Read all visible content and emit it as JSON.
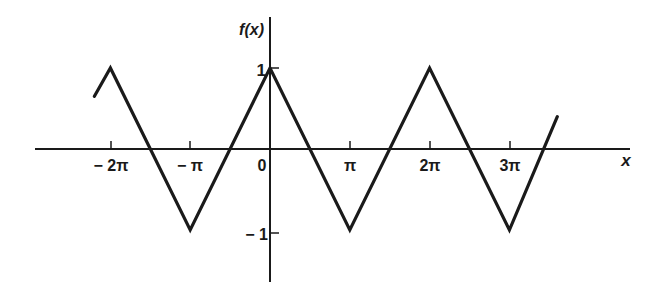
{
  "chart_data": {
    "type": "line",
    "title": "",
    "xlabel": "x",
    "ylabel": "f(x)",
    "x_tick_labels": [
      "− 2π",
      "− π",
      "0",
      "π",
      "2π",
      "3π"
    ],
    "x_tick_values_in_pi": [
      -2,
      -1,
      0,
      1,
      2,
      3
    ],
    "y_tick_labels": [
      "1",
      "− 1"
    ],
    "y_tick_values": [
      1,
      -1
    ],
    "xlim_in_pi": [
      -3.0,
      4.5
    ],
    "ylim": [
      -1.7,
      1.6
    ],
    "grid": false,
    "legend": null,
    "series": [
      {
        "name": "f(x) triangle wave",
        "description": "Periodic triangle wave, period 2π, amplitude 1, peaks at even multiples of π, troughs at odd multiples of π",
        "x_in_pi": [
          -2.2,
          -2,
          -1,
          0,
          1,
          2,
          3,
          3.6
        ],
        "y": [
          0.65,
          1,
          -1,
          1,
          -1,
          1,
          -1,
          0.4
        ]
      }
    ]
  },
  "axes": {
    "x_label": "x",
    "y_label": "f(x)"
  },
  "style": {
    "line_color": "#1a1a1a",
    "background": "#ffffff"
  }
}
